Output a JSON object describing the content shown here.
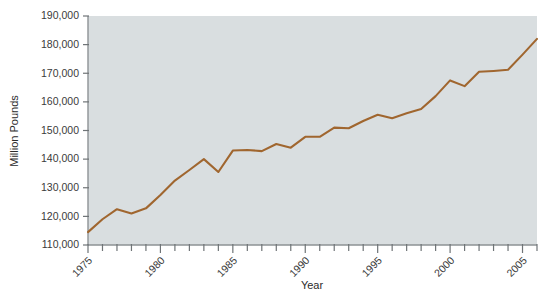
{
  "chart_data": {
    "type": "line",
    "title": "",
    "xlabel": "Year",
    "ylabel": "Million Pounds",
    "xlim": [
      1975,
      2006
    ],
    "ylim": [
      110000,
      190000
    ],
    "ytick_values": [
      110000,
      120000,
      130000,
      140000,
      150000,
      160000,
      170000,
      180000,
      190000
    ],
    "ytick_labels": [
      "110,000",
      "120,000",
      "130,000",
      "140,000",
      "150,000",
      "160,000",
      "170,000",
      "180,000",
      "190,000"
    ],
    "xtick_major_values": [
      1975,
      1980,
      1985,
      1990,
      1995,
      2000,
      2005
    ],
    "xtick_major_labels": [
      "1975",
      "1980",
      "1985",
      "1990",
      "1995",
      "2000",
      "2005"
    ],
    "xtick_minor_step": 1,
    "grid": false,
    "legend": false,
    "legend_position": "none",
    "series": [
      {
        "name": "Million Pounds",
        "color": "#a0662f",
        "x": [
          1975,
          1976,
          1977,
          1978,
          1979,
          1980,
          1981,
          1982,
          1983,
          1984,
          1985,
          1986,
          1987,
          1988,
          1989,
          1990,
          1991,
          1992,
          1993,
          1994,
          1995,
          1996,
          1997,
          1998,
          1999,
          2000,
          2001,
          2002,
          2003,
          2004,
          2005,
          2006
        ],
        "values": [
          114500,
          119000,
          122500,
          121000,
          122800,
          127500,
          132500,
          136200,
          140000,
          135500,
          143000,
          143200,
          142800,
          145300,
          144000,
          147800,
          147800,
          151000,
          150800,
          153300,
          155500,
          154300,
          156000,
          157500,
          162000,
          167500,
          165500,
          170500,
          170800,
          171200,
          176500,
          182000
        ]
      }
    ]
  },
  "axes": {
    "y_axis_title": "Million Pounds",
    "x_axis_title": "Year"
  },
  "style": {
    "plot_background": "#d9dee0",
    "line_color": "#a0662f",
    "axis_color": "#8d9295",
    "text_color": "#3a3a3a",
    "page_background": "#ffffff"
  }
}
